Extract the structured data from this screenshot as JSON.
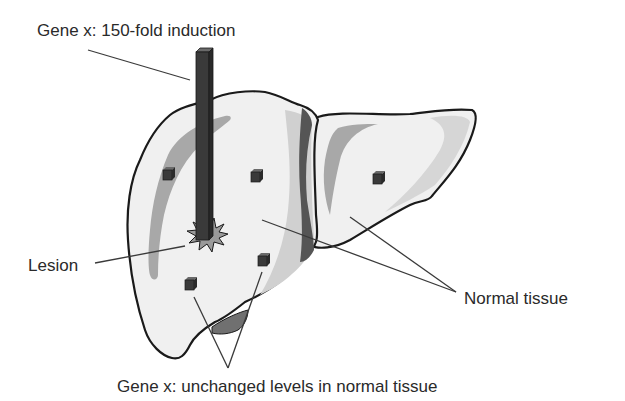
{
  "figure": {
    "labels": {
      "induction": "Gene x: 150-fold induction",
      "lesion": "Lesion",
      "normal_tissue": "Normal tissue",
      "unchanged": "Gene x: unchanged levels in normal tissue"
    },
    "elements": {
      "tall_bar": {
        "represents": "150-fold induction at lesion",
        "height_relative": 150
      },
      "small_bars": [
        {
          "location": "left lobe upper-left",
          "height_relative": 1
        },
        {
          "location": "left lobe upper-center",
          "height_relative": 1
        },
        {
          "location": "right lobe center",
          "height_relative": 1
        },
        {
          "location": "left lobe lower-left",
          "height_relative": 1
        },
        {
          "location": "left lobe lower-center",
          "height_relative": 1
        }
      ]
    },
    "colors": {
      "organ_fill": "#f0f0f0",
      "organ_outline": "#1a1a1a",
      "shading_mid": "#a8a8a8",
      "shading_light": "#d0d0d0",
      "shading_dark": "#555555",
      "bar_fill": "#3a3a3a",
      "lesion_fill": "#9a9a9a",
      "callout_line": "#3a3a3a",
      "text": "#2a2a2a"
    }
  }
}
